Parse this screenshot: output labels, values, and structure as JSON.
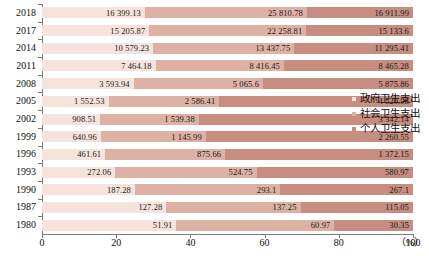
{
  "chart_data": {
    "type": "bar",
    "subtype": "stacked-horizontal-100-percent",
    "title": "",
    "xlabel": "",
    "ylabel": "",
    "xlim": [
      0,
      100
    ],
    "x_unit": "（%）",
    "x_ticks": [
      "0",
      "20",
      "40",
      "60",
      "80",
      "100"
    ],
    "x_tick_values": [
      0,
      20,
      40,
      60,
      80,
      100
    ],
    "grid": false,
    "legend_position": "right",
    "categories": [
      "2018",
      "2017",
      "2014",
      "2011",
      "2008",
      "2005",
      "2002",
      "1999",
      "1996",
      "1993",
      "1990",
      "1987",
      "1980"
    ],
    "series": [
      {
        "name": "政府卫生支出",
        "color": "#f6e4dc",
        "values": [
          16399.13,
          15205.87,
          10579.23,
          7464.18,
          3593.94,
          1552.53,
          908.51,
          640.96,
          461.61,
          272.06,
          187.28,
          127.28,
          51.91
        ],
        "labels": [
          "16 399.13",
          "15 205.87",
          "10 579.23",
          "7 464.18",
          "3 593.94",
          "1 552.53",
          "908.51",
          "640.96",
          "461.61",
          "272.06",
          "187.28",
          "127.28",
          "51.91"
        ]
      },
      {
        "name": "社会卫生支出",
        "color": "#ddb2a4",
        "values": [
          25810.78,
          22258.81,
          13437.75,
          8416.45,
          5065.6,
          2586.41,
          1539.38,
          1145.99,
          875.66,
          524.75,
          293.1,
          137.25,
          60.97
        ],
        "labels": [
          "25 810.78",
          "22 258.81",
          "13 437.75",
          "8 416.45",
          "5 065.6",
          "2 586.41",
          "1 539.38",
          "1 145.99",
          "875.66",
          "524.75",
          "293.1",
          "137.25",
          "60.97"
        ]
      },
      {
        "name": "个人卫生支出",
        "color": "#c68d80",
        "values": [
          16911.99,
          15133.6,
          11295.41,
          8465.28,
          5875.86,
          4520.98,
          3342.14,
          2260.55,
          1372.15,
          580.97,
          267.1,
          115.05,
          30.35
        ],
        "labels": [
          "16 911.99",
          "15 133.6",
          "11 295.41",
          "8 465.28",
          "5 875.86",
          "4 520.98",
          "3 342.14",
          "2 260.55",
          "1 372.15",
          "580.97",
          "267.1",
          "115.05",
          "30.35"
        ]
      }
    ]
  },
  "legend": {
    "items": [
      {
        "label": "政府卫生支出",
        "color": "#f6e4dc"
      },
      {
        "label": "社会卫生支出",
        "color": "#ddb2a4"
      },
      {
        "label": "个人卫生支出",
        "color": "#c68d80"
      }
    ]
  },
  "axis": {
    "x_unit_label": "（%）"
  }
}
